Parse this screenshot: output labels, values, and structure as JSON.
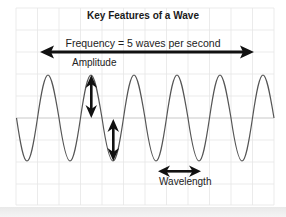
{
  "diagram": {
    "title": "Key Features of a Wave",
    "labels": {
      "frequency": "Frequency = 5 waves per second",
      "amplitude": "Amplitude",
      "wavelength": "Wavelength"
    },
    "colors": {
      "grid": "#e6e6e6",
      "axis": "#cfcfcf",
      "wave": "#555555",
      "arrow": "#111111",
      "background": "#ffffff"
    },
    "wave": {
      "type": "sine",
      "visible_peaks": 6,
      "visible_troughs": 6,
      "period_px": 43,
      "amplitude_px": 43
    }
  }
}
